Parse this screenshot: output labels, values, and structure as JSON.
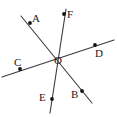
{
  "figure": {
    "kind": "geometry-line-diagram",
    "width": 117,
    "height": 117,
    "background_color": "#ffffff",
    "line_color": "#3a3a42",
    "point_color": "#111111",
    "label_color": "#1a1a1a",
    "label_font_size": 11,
    "line_width": 1.1,
    "point_radius": 1.9,
    "intersection": {
      "label": "O",
      "x": 59,
      "y": 54
    },
    "labels": [
      {
        "name": "A",
        "text": "A",
        "x": 32,
        "y": 13
      },
      {
        "name": "F",
        "text": "F",
        "x": 67,
        "y": 9
      },
      {
        "name": "D",
        "text": "D",
        "x": 95,
        "y": 48
      },
      {
        "name": "O",
        "text": "O",
        "x": 54,
        "y": 55
      },
      {
        "name": "C",
        "text": "C",
        "x": 14,
        "y": 57
      },
      {
        "name": "E",
        "text": "E",
        "x": 39,
        "y": 92
      },
      {
        "name": "B",
        "text": "B",
        "x": 71,
        "y": 89
      }
    ],
    "points": [
      {
        "name": "A",
        "x": 30,
        "y": 23
      },
      {
        "name": "F",
        "x": 64,
        "y": 14
      },
      {
        "name": "D",
        "x": 95,
        "y": 45
      },
      {
        "name": "C",
        "x": 20,
        "y": 69
      },
      {
        "name": "E",
        "x": 52,
        "y": 99
      },
      {
        "name": "B",
        "x": 82,
        "y": 91
      }
    ],
    "lines": [
      {
        "name": "line-AB",
        "through": [
          "A",
          "O",
          "B"
        ],
        "x1": 21,
        "y1": 16,
        "x2": 92,
        "y2": 103
      },
      {
        "name": "line-CD",
        "through": [
          "C",
          "O",
          "D"
        ],
        "x1": 2,
        "y1": 77,
        "x2": 114,
        "y2": 40
      },
      {
        "name": "line-FE",
        "through": [
          "F",
          "O",
          "E"
        ],
        "x1": 66,
        "y1": 9,
        "x2": 50,
        "y2": 113
      }
    ]
  }
}
